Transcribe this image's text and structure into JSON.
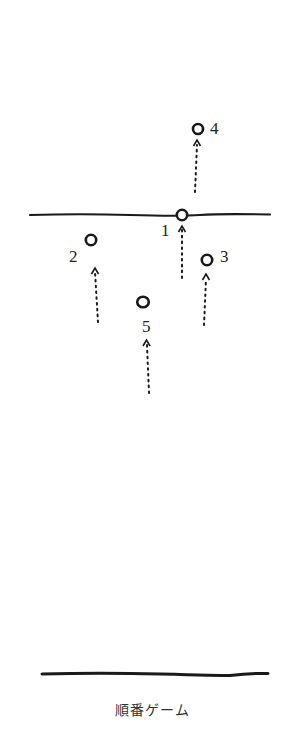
{
  "diagram": {
    "caption": "順番ゲーム",
    "ink_color": "#1a1a1a",
    "background": "#ffffff",
    "top_line": {
      "x1": 30,
      "x2": 270,
      "y": 215
    },
    "bottom_line": {
      "x1": 42,
      "x2": 268,
      "y": 674
    },
    "players": [
      {
        "id": "1",
        "label": "1",
        "cx": 182,
        "cy": 215,
        "label_x": 161,
        "label_y": 222,
        "arrow": {
          "x": 182,
          "y_from": 278,
          "y_to": 226
        }
      },
      {
        "id": "2",
        "label": "2",
        "cx": 91,
        "cy": 240,
        "label_x": 69,
        "label_y": 248,
        "arrow": {
          "x": 96,
          "y_from": 322,
          "y_to": 268
        }
      },
      {
        "id": "3",
        "label": "3",
        "cx": 207,
        "cy": 260,
        "label_x": 220,
        "label_y": 248,
        "arrow": {
          "x": 205,
          "y_from": 325,
          "y_to": 274
        }
      },
      {
        "id": "4",
        "label": "4",
        "cx": 198,
        "cy": 129,
        "label_x": 210,
        "label_y": 120,
        "arrow": {
          "x": 196,
          "y_from": 192,
          "y_to": 140
        }
      },
      {
        "id": "5",
        "label": "5",
        "cx": 143,
        "cy": 302,
        "label_x": 142,
        "label_y": 318,
        "arrow": {
          "x": 148,
          "y_from": 393,
          "y_to": 340
        }
      }
    ]
  }
}
